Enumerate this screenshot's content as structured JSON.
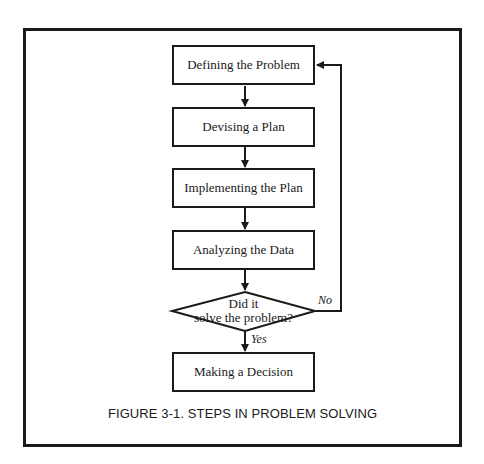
{
  "diagram": {
    "type": "flowchart",
    "steps": [
      {
        "id": "step1",
        "label": "Defining the Problem"
      },
      {
        "id": "step2",
        "label": "Devising a Plan"
      },
      {
        "id": "step3",
        "label": "Implementing the Plan"
      },
      {
        "id": "step4",
        "label": "Analyzing the Data"
      }
    ],
    "decision": {
      "line1": "Did it",
      "line2": "solve the problem?"
    },
    "final_step": {
      "label": "Making a Decision"
    },
    "edge_labels": {
      "yes": "Yes",
      "no": "No"
    },
    "caption": "FIGURE 3-1.  STEPS IN PROBLEM SOLVING",
    "colors": {
      "stroke": "#1a1a1a",
      "background": "#ffffff"
    }
  }
}
